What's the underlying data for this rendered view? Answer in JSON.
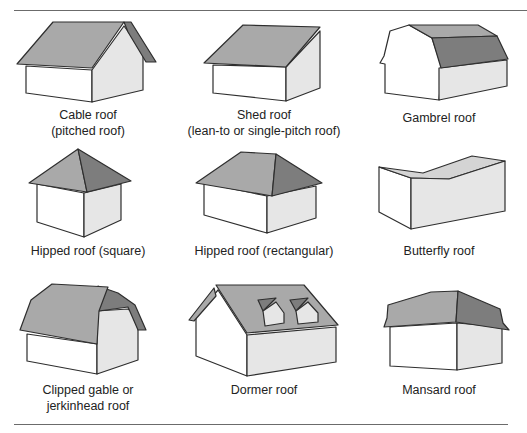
{
  "figure": {
    "colors": {
      "roof_light": "#a9a9a9",
      "roof_dark": "#7d7d7d",
      "wall_front": "#ffffff",
      "wall_side": "#e6e6e6",
      "outline": "#2e2e2e",
      "rule": "#6b6b6b"
    },
    "items": [
      {
        "id": "cable",
        "lines": [
          "Cable roof",
          "(pitched roof)"
        ]
      },
      {
        "id": "shed",
        "lines": [
          "Shed roof",
          "(lean-to or single-pitch roof)"
        ]
      },
      {
        "id": "gambrel",
        "lines": [
          "Gambrel roof"
        ]
      },
      {
        "id": "hipped-square",
        "lines": [
          "Hipped roof (square)"
        ]
      },
      {
        "id": "hipped-rect",
        "lines": [
          "Hipped roof (rectangular)"
        ]
      },
      {
        "id": "butterfly",
        "lines": [
          "Butterfly roof"
        ]
      },
      {
        "id": "clipped-gable",
        "lines": [
          "Clipped gable or",
          "jerkinhead roof"
        ]
      },
      {
        "id": "dormer",
        "lines": [
          "Dormer roof"
        ]
      },
      {
        "id": "mansard",
        "lines": [
          "Mansard roof"
        ]
      }
    ]
  }
}
